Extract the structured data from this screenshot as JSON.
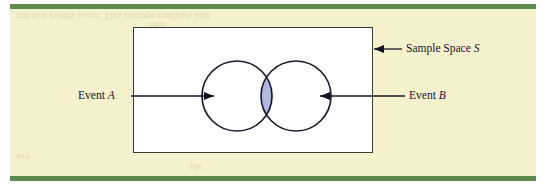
{
  "page": {
    "width": 548,
    "height": 190,
    "background_color": "#ffffff",
    "panel_color": "#f6f1cd",
    "rule_color": "#5e8a4e"
  },
  "diagram": {
    "type": "venn-diagram",
    "title_visible": false,
    "sample_space": {
      "shape": "rectangle",
      "fill_color": "#ffffff",
      "stroke_color": "#3a3a3a",
      "label": "Sample Space ",
      "label_italic_part": "S"
    },
    "sets": [
      {
        "name": "event-a",
        "label": "Event ",
        "label_italic_part": "A",
        "shape": "circle",
        "fill_color": "#ffffff",
        "stroke_color": "#1a1a2e",
        "arrow_direction": "right"
      },
      {
        "name": "event-b",
        "label": "Event ",
        "label_italic_part": "B",
        "shape": "circle",
        "fill_color": "#ffffff",
        "stroke_color": "#1a1a2e",
        "arrow_direction": "left"
      }
    ],
    "intersection": {
      "name": "a-intersect-b",
      "fill_color": "#b3b7de",
      "stroke_color": "#6a6fa8",
      "label": ""
    },
    "ghost_text": [
      "our two events occur. This concept confuses and",
      "ond",
      "ave",
      "ple"
    ]
  }
}
